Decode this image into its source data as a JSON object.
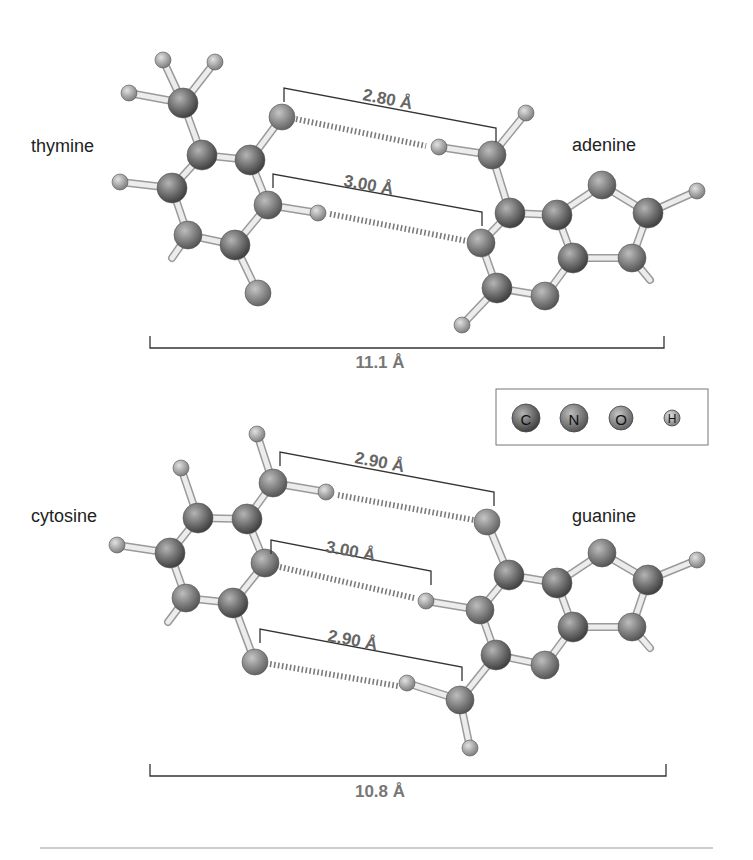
{
  "figure": {
    "legend": {
      "items": [
        {
          "symbol": "C",
          "element": "carbon",
          "color": "#6e6e6e",
          "r": 14
        },
        {
          "symbol": "N",
          "element": "nitrogen",
          "color": "#7d7d7d",
          "r": 14
        },
        {
          "symbol": "O",
          "element": "oxygen",
          "color": "#8c8c8c",
          "r": 12
        },
        {
          "symbol": "H",
          "element": "hydrogen",
          "color": "#a8a8a8",
          "r": 8
        }
      ]
    },
    "pairs": [
      {
        "name": "thymine-adenine",
        "left_label": "thymine",
        "right_label": "adenine",
        "hbonds": [
          "2.80 Å",
          "3.00 Å"
        ],
        "overall_width": "11.1 Å"
      },
      {
        "name": "cytosine-guanine",
        "left_label": "cytosine",
        "right_label": "guanine",
        "hbonds": [
          "2.90 Å",
          "3.00 Å",
          "2.90 Å"
        ],
        "overall_width": "10.8 Å"
      }
    ]
  },
  "geometry": {
    "atoms_ta": [
      {
        "id": "tCm",
        "el": "C",
        "x": 183,
        "y": 103
      },
      {
        "id": "tHm1",
        "el": "H",
        "x": 163,
        "y": 60
      },
      {
        "id": "tHm2",
        "el": "H",
        "x": 215,
        "y": 62
      },
      {
        "id": "tHm3",
        "el": "H",
        "x": 129,
        "y": 93
      },
      {
        "id": "tC5",
        "el": "C",
        "x": 202,
        "y": 155
      },
      {
        "id": "tC4",
        "el": "C",
        "x": 250,
        "y": 160
      },
      {
        "id": "tO4",
        "el": "O",
        "x": 282,
        "y": 117
      },
      {
        "id": "tN3",
        "el": "N",
        "x": 268,
        "y": 205
      },
      {
        "id": "tH3",
        "el": "H",
        "x": 318,
        "y": 213
      },
      {
        "id": "tC2",
        "el": "C",
        "x": 235,
        "y": 245
      },
      {
        "id": "tO2",
        "el": "O",
        "x": 258,
        "y": 293
      },
      {
        "id": "tN1",
        "el": "N",
        "x": 188,
        "y": 235
      },
      {
        "id": "tC6",
        "el": "C",
        "x": 172,
        "y": 188
      },
      {
        "id": "tH6",
        "el": "H",
        "x": 120,
        "y": 182
      },
      {
        "id": "aN6",
        "el": "N",
        "x": 492,
        "y": 155
      },
      {
        "id": "aH61",
        "el": "H",
        "x": 439,
        "y": 147
      },
      {
        "id": "aH62",
        "el": "H",
        "x": 526,
        "y": 113
      },
      {
        "id": "aC6",
        "el": "C",
        "x": 510,
        "y": 213
      },
      {
        "id": "aN1",
        "el": "N",
        "x": 481,
        "y": 243
      },
      {
        "id": "aC2",
        "el": "C",
        "x": 497,
        "y": 288
      },
      {
        "id": "aH2",
        "el": "H",
        "x": 462,
        "y": 325
      },
      {
        "id": "aN3",
        "el": "N",
        "x": 545,
        "y": 296
      },
      {
        "id": "aC4",
        "el": "C",
        "x": 573,
        "y": 258
      },
      {
        "id": "aC5",
        "el": "C",
        "x": 557,
        "y": 215
      },
      {
        "id": "aN7",
        "el": "N",
        "x": 602,
        "y": 185
      },
      {
        "id": "aC8",
        "el": "C",
        "x": 648,
        "y": 213
      },
      {
        "id": "aH8",
        "el": "H",
        "x": 697,
        "y": 191
      },
      {
        "id": "aN9",
        "el": "N",
        "x": 632,
        "y": 258
      }
    ],
    "bonds_ta": [
      [
        "tCm",
        "tHm1"
      ],
      [
        "tCm",
        "tHm2"
      ],
      [
        "tCm",
        "tHm3"
      ],
      [
        "tCm",
        "tC5"
      ],
      [
        "tC5",
        "tC4"
      ],
      [
        "tC4",
        "tN3"
      ],
      [
        "tN3",
        "tC2"
      ],
      [
        "tC2",
        "tN1"
      ],
      [
        "tN1",
        "tC6"
      ],
      [
        "tC6",
        "tC5"
      ],
      [
        "tC4",
        "tO4"
      ],
      [
        "tN3",
        "tH3"
      ],
      [
        "tC2",
        "tO2"
      ],
      [
        "tC6",
        "tH6"
      ],
      [
        "aN6",
        "aH61"
      ],
      [
        "aN6",
        "aH62"
      ],
      [
        "aN6",
        "aC6"
      ],
      [
        "aC6",
        "aN1"
      ],
      [
        "aN1",
        "aC2"
      ],
      [
        "aC2",
        "aN3"
      ],
      [
        "aN3",
        "aC4"
      ],
      [
        "aC4",
        "aC5"
      ],
      [
        "aC5",
        "aC6"
      ],
      [
        "aC5",
        "aN7"
      ],
      [
        "aN7",
        "aC8"
      ],
      [
        "aC8",
        "aN9"
      ],
      [
        "aN9",
        "aC4"
      ],
      [
        "aC8",
        "aH8"
      ],
      [
        "aC2",
        "aH2"
      ]
    ],
    "stubs_ta": [
      [
        188,
        235,
        172,
        258
      ],
      [
        632,
        258,
        650,
        280
      ]
    ],
    "hbonds_ta": [
      [
        296,
        119,
        426,
        146
      ],
      [
        330,
        214,
        467,
        241
      ]
    ],
    "brackets_ta": [
      {
        "x1": 284,
        "y1": 88,
        "x2": 496,
        "y2": 128,
        "tick": 14,
        "label_x": 362,
        "label_y": 100,
        "angle": 10.7
      },
      {
        "x1": 273,
        "y1": 174,
        "x2": 482,
        "y2": 212,
        "tick": 14,
        "label_x": 343,
        "label_y": 186,
        "angle": 10.3
      }
    ],
    "width_bar_ta": {
      "x1": 150,
      "x2": 664,
      "y": 348,
      "tick": 12,
      "label_x": 380,
      "label_y": 368
    },
    "label_pos_ta": {
      "left": {
        "x": 31,
        "y": 152
      },
      "right": {
        "x": 572,
        "y": 151
      }
    },
    "atoms_cg": [
      {
        "id": "cN4",
        "el": "N",
        "x": 273,
        "y": 483
      },
      {
        "id": "cH41",
        "el": "H",
        "x": 257,
        "y": 434
      },
      {
        "id": "cH42",
        "el": "H",
        "x": 326,
        "y": 492
      },
      {
        "id": "cC4",
        "el": "C",
        "x": 247,
        "y": 519
      },
      {
        "id": "cC5",
        "el": "C",
        "x": 198,
        "y": 518
      },
      {
        "id": "cH5",
        "el": "H",
        "x": 181,
        "y": 468
      },
      {
        "id": "cC6",
        "el": "C",
        "x": 170,
        "y": 553
      },
      {
        "id": "cH6",
        "el": "H",
        "x": 117,
        "y": 545
      },
      {
        "id": "cN1",
        "el": "N",
        "x": 186,
        "y": 598
      },
      {
        "id": "cC2",
        "el": "C",
        "x": 233,
        "y": 603
      },
      {
        "id": "cO2",
        "el": "O",
        "x": 255,
        "y": 662
      },
      {
        "id": "cN3",
        "el": "N",
        "x": 265,
        "y": 563
      },
      {
        "id": "gO6",
        "el": "O",
        "x": 487,
        "y": 522
      },
      {
        "id": "gC6",
        "el": "C",
        "x": 509,
        "y": 575
      },
      {
        "id": "gN1",
        "el": "N",
        "x": 480,
        "y": 610
      },
      {
        "id": "gH1",
        "el": "H",
        "x": 426,
        "y": 601
      },
      {
        "id": "gC2",
        "el": "C",
        "x": 496,
        "y": 655
      },
      {
        "id": "gN2",
        "el": "N",
        "x": 460,
        "y": 700
      },
      {
        "id": "gH21",
        "el": "H",
        "x": 407,
        "y": 683
      },
      {
        "id": "gH22",
        "el": "H",
        "x": 470,
        "y": 748
      },
      {
        "id": "gN3",
        "el": "N",
        "x": 545,
        "y": 665
      },
      {
        "id": "gC4",
        "el": "C",
        "x": 573,
        "y": 627
      },
      {
        "id": "gC5",
        "el": "C",
        "x": 557,
        "y": 583
      },
      {
        "id": "gN7",
        "el": "N",
        "x": 602,
        "y": 553
      },
      {
        "id": "gC8",
        "el": "C",
        "x": 648,
        "y": 580
      },
      {
        "id": "gH8",
        "el": "H",
        "x": 697,
        "y": 560
      },
      {
        "id": "gN9",
        "el": "N",
        "x": 632,
        "y": 627
      }
    ],
    "bonds_cg": [
      [
        "cN4",
        "cH41"
      ],
      [
        "cN4",
        "cH42"
      ],
      [
        "cN4",
        "cC4"
      ],
      [
        "cC4",
        "cC5"
      ],
      [
        "cC5",
        "cC6"
      ],
      [
        "cC6",
        "cN1"
      ],
      [
        "cN1",
        "cC2"
      ],
      [
        "cC2",
        "cN3"
      ],
      [
        "cN3",
        "cC4"
      ],
      [
        "cC5",
        "cH5"
      ],
      [
        "cC6",
        "cH6"
      ],
      [
        "cC2",
        "cO2"
      ],
      [
        "gO6",
        "gC6"
      ],
      [
        "gC6",
        "gN1"
      ],
      [
        "gN1",
        "gH1"
      ],
      [
        "gN1",
        "gC2"
      ],
      [
        "gC2",
        "gN2"
      ],
      [
        "gN2",
        "gH21"
      ],
      [
        "gN2",
        "gH22"
      ],
      [
        "gC2",
        "gN3"
      ],
      [
        "gN3",
        "gC4"
      ],
      [
        "gC4",
        "gC5"
      ],
      [
        "gC5",
        "gC6"
      ],
      [
        "gC5",
        "gN7"
      ],
      [
        "gN7",
        "gC8"
      ],
      [
        "gC8",
        "gN9"
      ],
      [
        "gN9",
        "gC4"
      ],
      [
        "gC8",
        "gH8"
      ]
    ],
    "stubs_cg": [
      [
        186,
        598,
        168,
        622
      ],
      [
        632,
        627,
        650,
        648
      ]
    ],
    "hbonds_cg": [
      [
        338,
        495,
        474,
        520
      ],
      [
        280,
        567,
        414,
        598
      ],
      [
        270,
        664,
        398,
        686
      ]
    ],
    "brackets_cg": [
      {
        "x1": 280,
        "y1": 452,
        "x2": 494,
        "y2": 492,
        "tick": 14,
        "label_x": 354,
        "label_y": 463,
        "angle": 10.5
      },
      {
        "x1": 271,
        "y1": 540,
        "x2": 431,
        "y2": 571,
        "tick": 14,
        "label_x": 325,
        "label_y": 552,
        "angle": 10.5
      },
      {
        "x1": 260,
        "y1": 629,
        "x2": 462,
        "y2": 667,
        "tick": 14,
        "label_x": 327,
        "label_y": 641,
        "angle": 10.5
      }
    ],
    "width_bar_cg": {
      "x1": 150,
      "x2": 666,
      "y": 776,
      "tick": 12,
      "label_x": 380,
      "label_y": 797
    },
    "label_pos_cg": {
      "left": {
        "x": 31,
        "y": 522
      },
      "right": {
        "x": 572,
        "y": 522
      }
    },
    "legend_box": {
      "x": 496,
      "y": 389,
      "w": 212,
      "h": 56,
      "cx": [
        526,
        574,
        621,
        672
      ],
      "cy": 418
    },
    "footer_rule": {
      "x1": 40,
      "x2": 713,
      "y": 848
    }
  }
}
